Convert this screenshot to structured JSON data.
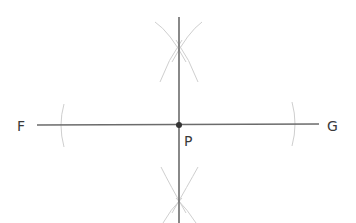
{
  "diagram": {
    "labels": {
      "left_point": "F",
      "right_point": "G",
      "intersection_point": "P"
    },
    "colors": {
      "line": "#6b6b6b",
      "arc": "#c8c8c8",
      "point": "#333333",
      "text": "#3a3a3a"
    }
  }
}
